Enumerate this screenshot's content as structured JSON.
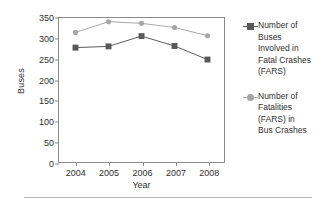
{
  "chart_data": {
    "type": "line",
    "title": "",
    "xlabel": "Year",
    "ylabel": "Buses",
    "categories": [
      "2004",
      "2005",
      "2006",
      "2007",
      "2008"
    ],
    "x": [
      2004,
      2005,
      2006,
      2007,
      2008
    ],
    "ylim": [
      0,
      350
    ],
    "yticks": [
      0,
      50,
      100,
      150,
      200,
      250,
      300,
      350
    ],
    "grid": false,
    "legend_position": "right",
    "series": [
      {
        "name": "Number of Buses Involved in Fatal Crashes (FARS)",
        "marker": "square",
        "color": "#595959",
        "values": [
          278,
          281,
          306,
          282,
          249
        ]
      },
      {
        "name": "Number of Fatalities (FARS) in Bus Crashes",
        "marker": "circle",
        "color": "#a6a6a6",
        "values": [
          315,
          341,
          337,
          327,
          307
        ]
      }
    ]
  },
  "legend": {
    "entries": [
      {
        "label": "Number of\nBuses\nInvolved in\nFatal Crashes\n(FARS)"
      },
      {
        "label": "Number of\nFatalities\n(FARS) in\nBus Crashes"
      }
    ]
  },
  "colors": {
    "series_1": "#595959",
    "series_2": "#a6a6a6",
    "axis": "#8a8a8a",
    "text": "#2f2f2f",
    "rule": "#b4b4b4"
  }
}
